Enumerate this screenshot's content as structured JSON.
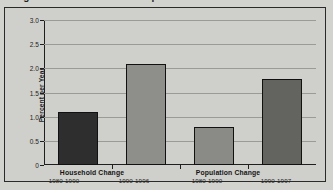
{
  "figure": {
    "title": "Figure 1. Household and Population Growth"
  },
  "chart_data": {
    "type": "bar",
    "title": "Household and Population Growth",
    "xlabel": "",
    "ylabel": "Percent per Year",
    "ylim": [
      0,
      3.0
    ],
    "ytick_labels": [
      "3.0",
      "2.5",
      "2.0",
      "1.5",
      "1.0",
      "0.5",
      "0"
    ],
    "ytick_values": [
      3.0,
      2.5,
      2.0,
      1.5,
      1.0,
      0.5,
      0
    ],
    "grid": true,
    "legend": "none",
    "categories": [
      "1980-1990",
      "1990-1996",
      "1980-1990",
      "1990-1997"
    ],
    "values": [
      1.1,
      2.09,
      0.79,
      1.78
    ],
    "bar_colors": [
      "#2e2e2e",
      "#8e8e8a",
      "#8a8a86",
      "#636360"
    ],
    "groups": [
      {
        "label": "Household Change",
        "bars": [
          {
            "period": "1980-1990",
            "value": 1.1
          },
          {
            "period": "1990-1996",
            "value": 2.09
          }
        ]
      },
      {
        "label": "Population Change",
        "bars": [
          {
            "period": "1980-1990",
            "value": 0.79
          },
          {
            "period": "1990-1997",
            "value": 1.78
          }
        ]
      }
    ]
  }
}
